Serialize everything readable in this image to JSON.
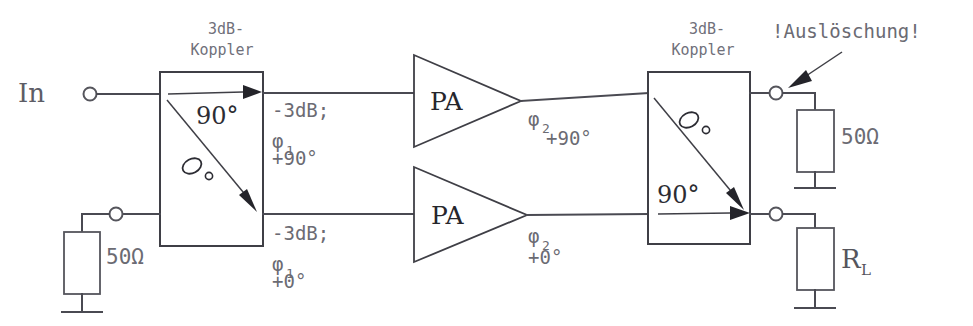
{
  "diagram": {
    "input": {
      "label": "In",
      "terminal_icon": "open-circle-terminal"
    },
    "couplers": [
      {
        "id": "input-coupler",
        "heading_line1": "3dB-",
        "heading_line2": "Koppler",
        "through_label": "90°",
        "coupled_label": "0",
        "coupled_degree_mark": "°"
      },
      {
        "id": "output-coupler",
        "heading_line1": "3dB-",
        "heading_line2": "Koppler",
        "through_label": "90°",
        "coupled_label": "0",
        "coupled_degree_mark": "°"
      }
    ],
    "amplifiers": [
      {
        "id": "pa-top",
        "label": "PA"
      },
      {
        "id": "pa-bottom",
        "label": "PA"
      }
    ],
    "branch_labels": {
      "top_after_coupler": {
        "line1": "-3dB;",
        "phi": "φ",
        "phi_sub": "1",
        "line3": "+90°"
      },
      "bottom_after_coupler": {
        "line1": "-3dB;",
        "phi": "φ",
        "phi_sub": "1",
        "line3": "+0°"
      },
      "top_after_pa": {
        "phi": "φ",
        "phi_sub": "2",
        "line2": "+90°"
      },
      "bottom_after_pa": {
        "phi": "φ",
        "phi_sub": "2",
        "line2": "+0°"
      }
    },
    "annotation": {
      "text": "!Auslöschung!",
      "arrow_icon": "arrow-pointing-down-left"
    },
    "terminations": [
      {
        "id": "input-coupler-iso-load",
        "label": "50Ω",
        "ground_icon": "ground-symbol"
      },
      {
        "id": "output-coupler-iso-load",
        "label": "50Ω",
        "ground_icon": "ground-symbol"
      },
      {
        "id": "load",
        "label": "R",
        "sub": "L",
        "ground_icon": "ground-symbol"
      }
    ],
    "colors": {
      "wire": "#4a4a52",
      "text_gray": "#6b6b73",
      "text_dark": "#2c2c33",
      "background": "#ffffff"
    }
  }
}
